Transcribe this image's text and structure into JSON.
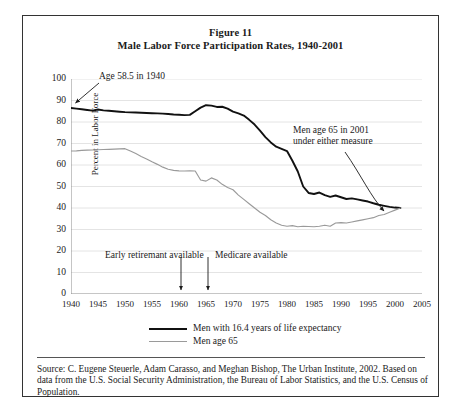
{
  "figure": {
    "title_line1": "Figure 11",
    "title_line2": "Male Labor Force Participation Rates, 1940-2001"
  },
  "source": {
    "text": "Source: C. Eugene Steuerle, Adam Carasso, and Meghan Bishop, The Urban Institute, 2002. Based on data from the U.S. Social Security Administration, the Bureau of Labor Statistics, and the U.S. Census of Population."
  },
  "annotations": {
    "age_58_5": "Age 58.5 in 1940",
    "early_retirement": "Early retiremant available",
    "medicare": "Medicare available",
    "men_65_line1": "Men age 65 in 2001",
    "men_65_line2": "under either measure"
  },
  "colors": {
    "series_black": "#111111",
    "series_gray": "#9a9a9a",
    "grid": "#e4e4e4",
    "axis": "#8c8c8c",
    "frame": "#333333",
    "text": "#1a1a1a"
  },
  "chart_data": {
    "type": "line",
    "title": "Male Labor Force Participation Rates, 1940-2001",
    "xlabel": "",
    "ylabel": "Percent in Labor Force",
    "xlim": [
      1940,
      2005
    ],
    "ylim": [
      0,
      100
    ],
    "xticks": [
      1940,
      1945,
      1950,
      1955,
      1960,
      1965,
      1970,
      1975,
      1980,
      1985,
      1990,
      1995,
      2000,
      2005
    ],
    "yticks": [
      0,
      10,
      20,
      30,
      40,
      50,
      60,
      70,
      80,
      90,
      100
    ],
    "grid": true,
    "legend_position": "below-axes",
    "annotations": [
      {
        "text": "Age 58.5 in 1940",
        "points_to_year": 1940,
        "points_to_value": 86.5
      },
      {
        "text": "Early retiremant available",
        "points_to_year": 1960,
        "marker": "down-arrow"
      },
      {
        "text": "Medicare available",
        "points_to_year": 1965,
        "marker": "down-arrow"
      },
      {
        "text": "Men age 65 in 2001 under either measure",
        "points_to_year": 2001,
        "points_to_value": 40.0
      }
    ],
    "series": [
      {
        "name": "Men with 16.4 years of life expectancy",
        "color": "#111111",
        "x": [
          1940,
          1941,
          1942,
          1943,
          1944,
          1945,
          1946,
          1947,
          1948,
          1949,
          1950,
          1951,
          1952,
          1953,
          1954,
          1955,
          1956,
          1957,
          1958,
          1959,
          1960,
          1961,
          1962,
          1963,
          1964,
          1965,
          1966,
          1967,
          1968,
          1969,
          1970,
          1971,
          1972,
          1973,
          1974,
          1975,
          1976,
          1977,
          1978,
          1979,
          1980,
          1981,
          1982,
          1983,
          1984,
          1985,
          1986,
          1987,
          1988,
          1989,
          1990,
          1991,
          1992,
          1993,
          1994,
          1995,
          1996,
          1997,
          1998,
          1999,
          2000,
          2001
        ],
        "y": [
          86.5,
          86.2,
          85.9,
          85.6,
          85.3,
          85.8,
          85.4,
          85.2,
          85.0,
          84.8,
          84.6,
          84.5,
          84.4,
          84.3,
          84.2,
          84.1,
          84.0,
          83.9,
          83.7,
          83.5,
          83.4,
          83.2,
          83.3,
          85.0,
          86.7,
          87.8,
          87.6,
          87.0,
          87.1,
          86.2,
          84.8,
          84.0,
          83.0,
          81.0,
          78.8,
          76.0,
          73.0,
          70.5,
          68.5,
          67.5,
          66.5,
          62.0,
          57.0,
          50.0,
          47.0,
          46.5,
          47.2,
          46.0,
          45.2,
          45.8,
          45.0,
          44.2,
          44.5,
          44.0,
          43.5,
          43.0,
          42.2,
          41.5,
          41.0,
          40.5,
          40.2,
          40.0
        ]
      },
      {
        "name": "Men age 65",
        "color": "#9a9a9a",
        "x": [
          1940,
          1941,
          1942,
          1943,
          1944,
          1945,
          1946,
          1947,
          1948,
          1949,
          1950,
          1951,
          1952,
          1953,
          1954,
          1955,
          1956,
          1957,
          1958,
          1959,
          1960,
          1961,
          1962,
          1963,
          1964,
          1965,
          1966,
          1967,
          1968,
          1969,
          1970,
          1971,
          1972,
          1973,
          1974,
          1975,
          1976,
          1977,
          1978,
          1979,
          1980,
          1981,
          1982,
          1983,
          1984,
          1985,
          1986,
          1987,
          1988,
          1989,
          1990,
          1991,
          1992,
          1993,
          1994,
          1995,
          1996,
          1997,
          1998,
          1999,
          2000,
          2001
        ],
        "y": [
          66.5,
          66.6,
          66.8,
          66.9,
          67.0,
          67.1,
          67.2,
          67.3,
          67.4,
          67.5,
          67.6,
          66.5,
          65.3,
          64.0,
          62.8,
          61.5,
          60.3,
          59.0,
          58.0,
          57.5,
          57.3,
          57.2,
          57.3,
          57.2,
          53.0,
          52.5,
          54.0,
          53.0,
          51.0,
          49.5,
          48.5,
          46.0,
          44.0,
          42.0,
          40.0,
          38.0,
          36.5,
          34.5,
          33.0,
          32.0,
          31.5,
          31.8,
          31.3,
          31.5,
          31.4,
          31.3,
          31.5,
          32.0,
          31.5,
          33.0,
          33.2,
          33.0,
          33.5,
          34.0,
          34.5,
          35.0,
          35.5,
          36.5,
          37.0,
          38.0,
          39.0,
          40.0
        ]
      }
    ]
  }
}
